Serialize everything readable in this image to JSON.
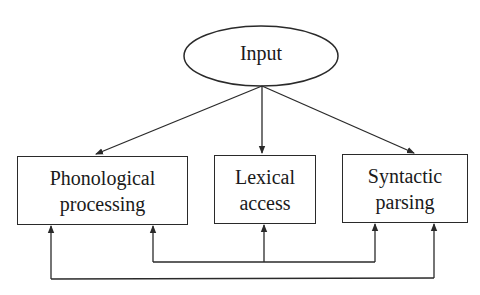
{
  "diagram": {
    "type": "flow-diagram",
    "input_node": {
      "label": "Input",
      "shape": "ellipse"
    },
    "processing_nodes": [
      {
        "id": "phonological",
        "line1": "Phonological",
        "line2": "processing"
      },
      {
        "id": "lexical",
        "line1": "Lexical",
        "line2": "access"
      },
      {
        "id": "syntactic",
        "line1": "Syntactic",
        "line2": "parsing"
      }
    ],
    "edges": [
      {
        "from": "Input",
        "to": "Phonological processing",
        "type": "arrow"
      },
      {
        "from": "Input",
        "to": "Lexical access",
        "type": "arrow"
      },
      {
        "from": "Input",
        "to": "Syntactic parsing",
        "type": "arrow"
      },
      {
        "from": "Lexical access",
        "to": "Phonological processing",
        "type": "arrow",
        "route": "inner-loop"
      },
      {
        "from": "Lexical access",
        "to": "Syntactic parsing",
        "type": "arrow",
        "route": "inner-loop"
      },
      {
        "from": "Phonological processing",
        "to": "Syntactic parsing",
        "type": "bidirectional-arrow",
        "route": "outer-loop"
      }
    ],
    "colors": {
      "stroke": "#2a2a2a",
      "text": "#1a1a1a",
      "background": "#ffffff"
    }
  }
}
